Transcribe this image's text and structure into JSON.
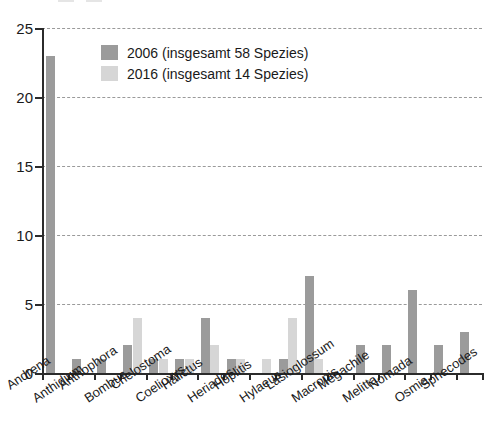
{
  "chart_data": {
    "type": "bar",
    "title": "",
    "xlabel": "",
    "ylabel": "",
    "ylim": [
      0,
      25
    ],
    "yticks": [
      0,
      5,
      10,
      15,
      20,
      25
    ],
    "grid": true,
    "legend_position": "top-left",
    "categories": [
      "Andrena",
      "Anthidium",
      "Anthophora",
      "Bombus",
      "Chelostoma",
      "Coelioxys",
      "Halictus",
      "Heriades",
      "Hoplitis",
      "Hylaeus",
      "Lasioglossum",
      "Macropis",
      "Megachile",
      "Melitta",
      "Nomada",
      "Osmia",
      "Sphecodes"
    ],
    "series": [
      {
        "name": "2006 (insgesamt 58 Spezies)",
        "color": "#9b9b9b",
        "values": [
          23,
          1,
          1,
          2,
          1,
          1,
          4,
          1,
          0,
          1,
          7,
          0,
          2,
          2,
          6,
          2,
          3
        ]
      },
      {
        "name": "2016 (insgesamt 14 Spezies)",
        "color": "#d6d6d6",
        "values": [
          0,
          0,
          0,
          4,
          1,
          1,
          2,
          1,
          1,
          4,
          1,
          0,
          0,
          0,
          0,
          0,
          0
        ]
      }
    ]
  },
  "legend": {
    "entries": [
      {
        "label": "2006 (insgesamt 58 Spezies)"
      },
      {
        "label": "2016 (insgesamt 14 Spezies)"
      }
    ]
  },
  "axes": {
    "y_tick_labels": [
      "25",
      "20",
      "15",
      "10",
      "5",
      "0"
    ]
  }
}
